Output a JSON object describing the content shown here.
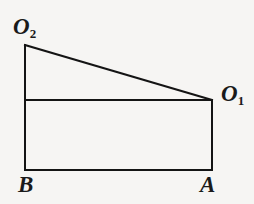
{
  "figure": {
    "background_color": "#f6f5f3",
    "stroke_color": "#141414",
    "stroke_width": 2,
    "width": 254,
    "height": 204,
    "vertices": {
      "O2": {
        "label_base": "O",
        "label_sub": "2",
        "x": 25,
        "y": 45
      },
      "O1": {
        "label_base": "O",
        "label_sub": "1",
        "x": 212,
        "y": 100
      },
      "B": {
        "label_base": "B",
        "label_sub": "",
        "x": 25,
        "y": 170
      },
      "A": {
        "label_base": "A",
        "label_sub": "",
        "x": 212,
        "y": 170
      }
    },
    "segments": [
      {
        "name": "left-side-O2-to-B",
        "x1": 25,
        "y1": 45,
        "x2": 25,
        "y2": 170
      },
      {
        "name": "hypotenuse-O2-to-O1",
        "x1": 25,
        "y1": 45,
        "x2": 212,
        "y2": 100
      },
      {
        "name": "rectangle-top-edge",
        "x1": 25,
        "y1": 100,
        "x2": 212,
        "y2": 100
      },
      {
        "name": "rectangle-right-edge",
        "x1": 212,
        "y1": 100,
        "x2": 212,
        "y2": 170
      },
      {
        "name": "rectangle-bottom-edge",
        "x1": 25,
        "y1": 170,
        "x2": 212,
        "y2": 170
      }
    ]
  }
}
